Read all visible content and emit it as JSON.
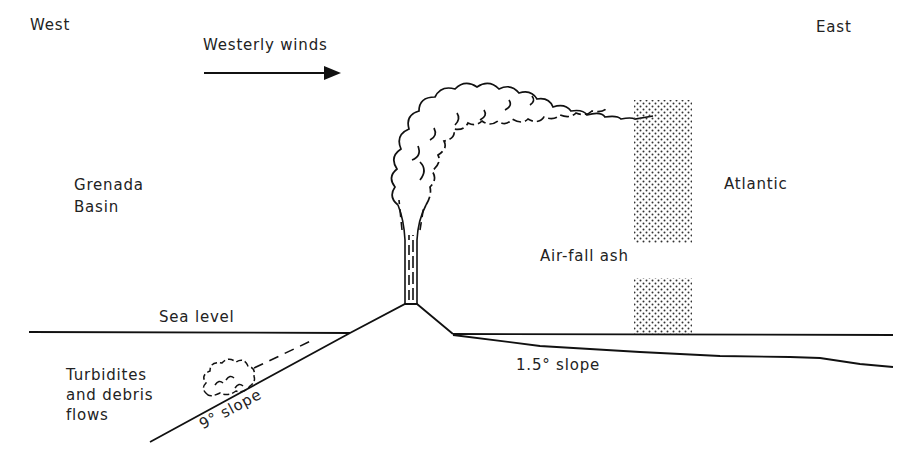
{
  "diagram": {
    "type": "cross-section",
    "labels": {
      "west": "West",
      "east": "East",
      "winds": "Westerly winds",
      "basin_line1": "Grenada",
      "basin_line2": "Basin",
      "ocean": "Atlantic",
      "ash": "Air-fall ash",
      "sea_level": "Sea level",
      "turbidites_line1": "Turbidites",
      "turbidites_line2": "and debris",
      "turbidites_line3": "flows",
      "west_slope": "9° slope",
      "east_slope": "1.5° slope"
    },
    "colors": {
      "line": "#111111",
      "background": "#ffffff",
      "stipple": "#333333"
    }
  }
}
